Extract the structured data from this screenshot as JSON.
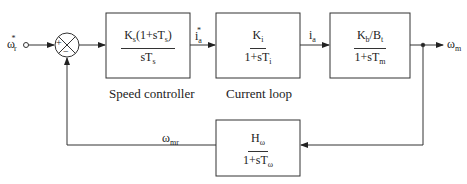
{
  "diagram": {
    "type": "block-diagram",
    "input": {
      "symbol": "ω",
      "sub": "r",
      "sup": "*"
    },
    "output": {
      "symbol": "ω",
      "sub": "m"
    },
    "summing_junction": {
      "plus": "+",
      "minus": "−"
    },
    "blocks": [
      {
        "id": "speed-controller",
        "caption": "Speed controller",
        "numerator": {
          "k": "K",
          "k_sub": "s",
          "rest_pre": "(1+sT",
          "rest_sub": "s",
          "rest_post": ")"
        },
        "denominator": {
          "pre": "sT",
          "sub": "s"
        }
      },
      {
        "id": "current-loop",
        "caption": "Current loop",
        "numerator": {
          "k": "K",
          "k_sub": "i"
        },
        "denominator": {
          "pre": "1+sT",
          "sub": "i"
        }
      },
      {
        "id": "motor",
        "caption": "",
        "numerator": {
          "a": "K",
          "a_sub": "b",
          "slash": "/B",
          "b_sub": "t"
        },
        "denominator": {
          "pre": "1+sT",
          "sub": "m"
        }
      },
      {
        "id": "speed-filter",
        "caption": "",
        "numerator": {
          "k": "H",
          "k_sub": "ω"
        },
        "denominator": {
          "pre": "1+sT",
          "sub": "ω"
        }
      }
    ],
    "signals": {
      "current_ref": {
        "symbol": "i",
        "sub": "a",
        "sup": "*"
      },
      "current": {
        "symbol": "i",
        "sub": "a"
      },
      "feedback": {
        "symbol": "ω",
        "sub": "mr"
      }
    }
  }
}
